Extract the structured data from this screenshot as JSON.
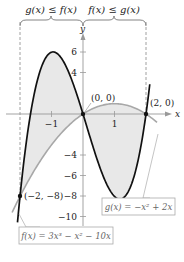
{
  "chart_data": {
    "type": "line",
    "title": "",
    "xlabel": "x",
    "ylabel": "y",
    "xlim": [
      -2.3,
      2.6
    ],
    "ylim": [
      -11,
      7.5
    ],
    "x_ticks": [
      -1,
      1
    ],
    "y_ticks": [
      -10,
      -8,
      -6,
      -4,
      4,
      6
    ],
    "x_tick_labels": [
      "−1",
      "1"
    ],
    "y_tick_labels": [
      "−10",
      "−8",
      "−6",
      "−4",
      "4",
      "6"
    ],
    "series": [
      {
        "name": "f(x) = 3x³ − x² − 10x",
        "label": "f(x) = 3x³ − x² − 10x",
        "color": "#111111",
        "style": "solid-thick",
        "x": [
          -2.0,
          -1.5,
          -1.0,
          -0.9,
          -0.5,
          0.0,
          0.5,
          1.0,
          1.12,
          1.5,
          2.0,
          2.1
        ],
        "values": [
          -8,
          2.62,
          6,
          6.06,
          3.38,
          0,
          -4.88,
          -8,
          -8.28,
          -7.13,
          0,
          2.37
        ]
      },
      {
        "name": "g(x) = −x² + 2x",
        "label": "g(x) = −x² + 2x",
        "color": "#999999",
        "style": "solid-gray",
        "x": [
          -2.0,
          -1.0,
          0.0,
          0.5,
          1.0,
          1.5,
          2.0,
          2.3
        ],
        "values": [
          -8,
          -3,
          0,
          0.75,
          1,
          0.75,
          0,
          -0.69
        ]
      }
    ],
    "intersection_points": [
      {
        "label": "(−2, −8)",
        "x": -2,
        "y": -8
      },
      {
        "label": "(0, 0)",
        "x": 0,
        "y": 0
      },
      {
        "label": "(2, 0)",
        "x": 2,
        "y": 0
      }
    ],
    "shaded_regions": [
      {
        "from": -2,
        "to": 0,
        "between": [
          "g",
          "f"
        ],
        "color": "#e6e6e6"
      },
      {
        "from": 0,
        "to": 2,
        "between": [
          "f",
          "g"
        ],
        "color": "#e6e6e6"
      }
    ],
    "annotations": {
      "brace_left": "g(x) ≤ f(x)",
      "brace_right": "f(x) ≤ g(x)"
    },
    "grid": false
  },
  "labels": {
    "axis_x": "x",
    "axis_y": "y",
    "brace_left": "g(x) ≤ f(x)",
    "brace_right": "f(x) ≤ g(x)",
    "pt_origin": "(0, 0)",
    "pt_right": "(2, 0)",
    "pt_left": "(−2, −8)",
    "f_label": "f(x) = 3x³ − x² − 10x",
    "g_label": "g(x) = −x² + 2x",
    "tick_x_neg1": "−1",
    "tick_x_1": "1",
    "tick_y_6": "6",
    "tick_y_4": "4",
    "tick_y_neg4": "−4",
    "tick_y_neg6": "−6",
    "tick_y_neg8": "−8",
    "tick_y_neg10": "−10"
  }
}
